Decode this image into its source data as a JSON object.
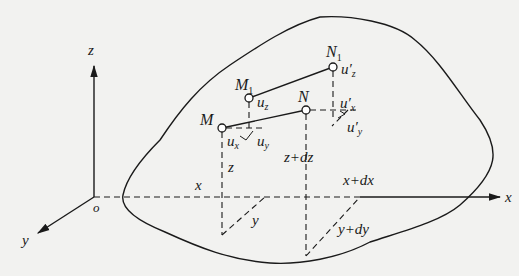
{
  "diagram": {
    "type": "3d-deformation-body",
    "axes": {
      "origin_label": "o",
      "x_label": "x",
      "y_label": "y",
      "z_label": "z"
    },
    "points": {
      "M": {
        "label": "M",
        "sub": ""
      },
      "M1": {
        "label": "M",
        "sub": "1"
      },
      "N": {
        "label": "N",
        "sub": ""
      },
      "N1": {
        "label": "N",
        "sub": "1"
      }
    },
    "displacements": {
      "ux": {
        "base": "u",
        "sub": "x"
      },
      "uy": {
        "base": "u",
        "sub": "y"
      },
      "uz": {
        "base": "u",
        "sub": "z"
      },
      "ux_prime": {
        "base": "u′",
        "sub": "x"
      },
      "uy_prime": {
        "base": "u′",
        "sub": "y"
      },
      "uz_prime": {
        "base": "u′",
        "sub": "z"
      }
    },
    "coordinate_labels": {
      "x": "x",
      "y": "y",
      "z": "z",
      "x_dx": "x+dx",
      "y_dy": "y+dy",
      "z_dz": "z+dz"
    },
    "colors": {
      "background": "#f2f2f0",
      "ink": "#1a1a1a"
    }
  }
}
